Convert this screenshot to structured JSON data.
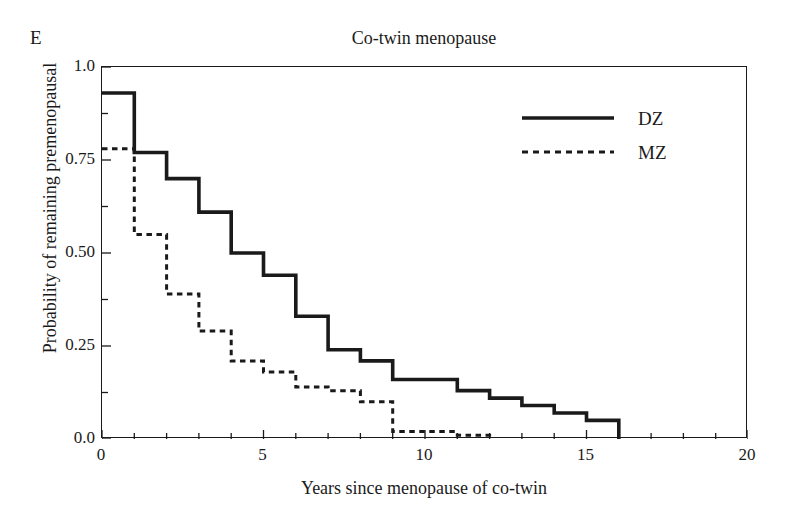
{
  "figure": {
    "panel_label": "E",
    "top_artifact_text": "",
    "title": "Co-twin menopause"
  },
  "axes": {
    "xlabel": "Years since menopause of co-twin",
    "ylabel": "Probability of remaining premenopausal",
    "xticks": [
      "0",
      "5",
      "10",
      "15",
      "20"
    ],
    "yticks": [
      "1.0",
      "0.75",
      "0.50",
      "0.25",
      "0.0"
    ]
  },
  "legend": {
    "position": "top-right",
    "entries": [
      {
        "label": "DZ",
        "style": "solid"
      },
      {
        "label": "MZ",
        "style": "dashed"
      }
    ]
  },
  "colors": {
    "line": "#1a1a1a",
    "axis": "#1a1a1a",
    "background": "#ffffff"
  },
  "chart_data": {
    "type": "line",
    "subtype": "kaplan-meier-step",
    "title": "Co-twin menopause",
    "xlabel": "Years since menopause of co-twin",
    "ylabel": "Probability of remaining premenopausal",
    "xlim": [
      0,
      20
    ],
    "ylim": [
      0,
      1.0
    ],
    "xticks": [
      0,
      5,
      10,
      15,
      20
    ],
    "xminor_tick_step": 1,
    "yticks": [
      0,
      0.25,
      0.5,
      0.75,
      1.0
    ],
    "yminor_tick_step": 0.125,
    "grid": false,
    "legend_position": "top-right",
    "panel_label": "E",
    "series": [
      {
        "name": "DZ",
        "style": "solid",
        "x": [
          0,
          1,
          2,
          3,
          4,
          5,
          6,
          7,
          8,
          9,
          10,
          11,
          12,
          13,
          14,
          15,
          16
        ],
        "values": [
          0.93,
          0.77,
          0.7,
          0.61,
          0.5,
          0.44,
          0.33,
          0.24,
          0.21,
          0.16,
          0.16,
          0.13,
          0.11,
          0.09,
          0.07,
          0.05,
          0.0
        ]
      },
      {
        "name": "MZ",
        "style": "dashed",
        "x": [
          0,
          1,
          2,
          3,
          4,
          5,
          6,
          7,
          8,
          9,
          10,
          11,
          12
        ],
        "values": [
          0.78,
          0.55,
          0.39,
          0.29,
          0.21,
          0.18,
          0.14,
          0.13,
          0.1,
          0.02,
          0.02,
          0.01,
          0.0
        ]
      }
    ]
  }
}
